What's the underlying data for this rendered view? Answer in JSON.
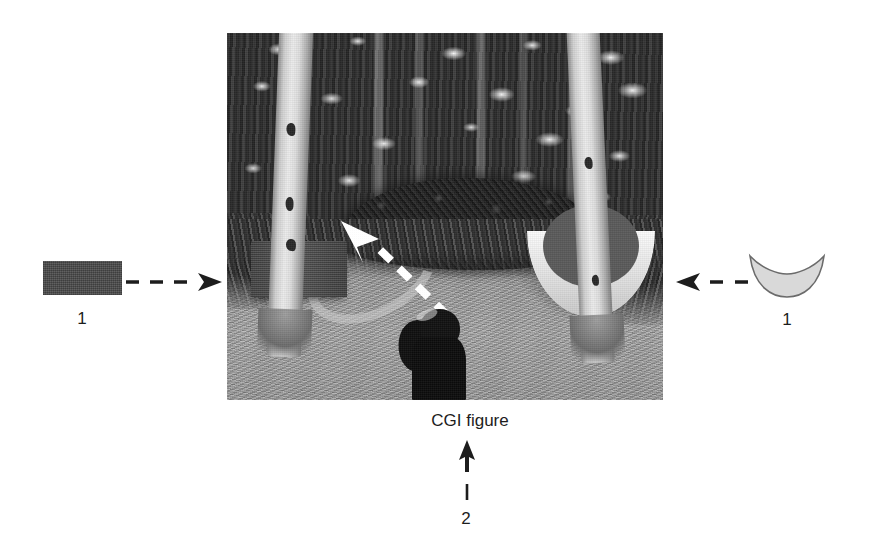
{
  "figure": {
    "caption": "CGI figure",
    "photo_description": "Grayscale forest photograph with two birch tree trunks, dark bush, gravel ground and a silhouetted person",
    "callouts": [
      {
        "id": "left-callout",
        "label": "1",
        "shape": "rectangle",
        "shape_name": "cgi-cube-swatch",
        "color": "#4e4e4e",
        "arrow_direction": "right",
        "arrow_style": "dashed",
        "points_to": "composited CGI cube in photograph"
      },
      {
        "id": "right-callout",
        "label": "1",
        "shape": "crescent",
        "shape_name": "cgi-bowl-swatch",
        "color": "#d9d9d9",
        "arrow_direction": "left",
        "arrow_style": "dashed",
        "points_to": "composited CGI bowl in photograph"
      },
      {
        "id": "bottom-callout",
        "label": "2",
        "shape": "leader-line",
        "shape_name": "cgi-figure-leader",
        "arrow_direction": "up",
        "arrow_style": "solid",
        "points_to": "CGI figure caption"
      }
    ],
    "in_photo_annotation": {
      "name": "white-dashed-arrow",
      "direction": "up-left",
      "color": "#ffffff",
      "style": "dashed"
    },
    "colors": {
      "background": "#ffffff",
      "ink": "#1d1d1d",
      "cube_swatch": "#4e4e4e",
      "bowl_swatch": "#d9d9d9"
    }
  }
}
